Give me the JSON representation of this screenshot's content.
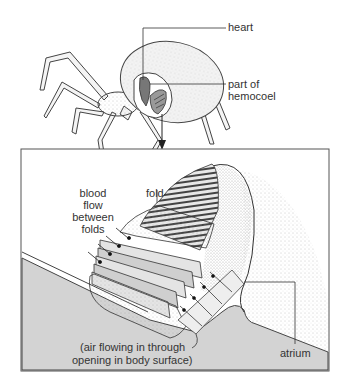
{
  "diagram": {
    "colors": {
      "line": "#333333",
      "body_fill": "#f2f2f2",
      "heart_fill": "#777777",
      "surface_fill": "#d3d3d3",
      "box_fill": "#ffffff",
      "stipple": "#9a9a9a"
    },
    "labels": {
      "heart": "heart",
      "hemocoel_line1": "part of",
      "hemocoel_line2": "hemocoel",
      "blood_line1": "blood",
      "blood_line2": "flow",
      "blood_line3": "between",
      "blood_line4": "folds",
      "fold": "fold",
      "air_line1": "(air flowing in through",
      "air_line2": "opening in body surface)",
      "atrium": "atrium"
    }
  }
}
